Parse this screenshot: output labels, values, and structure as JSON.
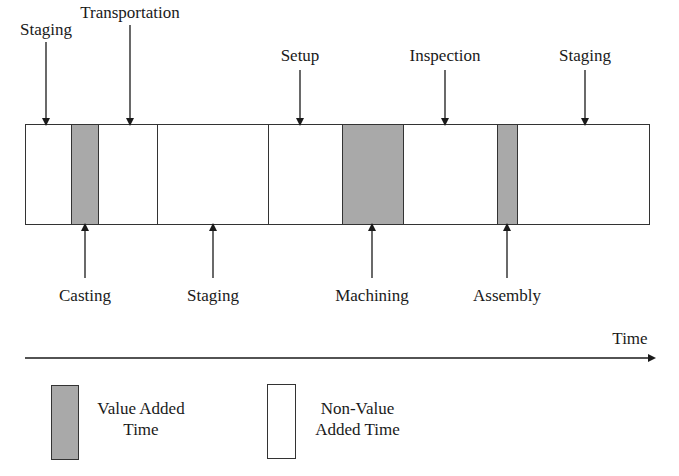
{
  "diagram": {
    "type": "value-stream-timeline",
    "segments": [
      {
        "name": "Staging",
        "kind": "non-value-added",
        "x0": 25,
        "x1": 71,
        "label_position": "top"
      },
      {
        "name": "Casting",
        "kind": "value-added",
        "x0": 71,
        "x1": 98,
        "label_position": "bottom"
      },
      {
        "name": "Transportation",
        "kind": "non-value-added",
        "x0": 98,
        "x1": 157,
        "label_position": "top"
      },
      {
        "name": "Staging",
        "kind": "non-value-added",
        "x0": 157,
        "x1": 268,
        "label_position": "bottom"
      },
      {
        "name": "Setup",
        "kind": "non-value-added",
        "x0": 268,
        "x1": 342,
        "label_position": "top"
      },
      {
        "name": "Machining",
        "kind": "value-added",
        "x0": 342,
        "x1": 403,
        "label_position": "bottom"
      },
      {
        "name": "Inspection",
        "kind": "non-value-added",
        "x0": 403,
        "x1": 497,
        "label_position": "top"
      },
      {
        "name": "Assembly",
        "kind": "value-added",
        "x0": 497,
        "x1": 517,
        "label_position": "bottom"
      },
      {
        "name": "Staging",
        "kind": "non-value-added",
        "x0": 517,
        "x1": 650,
        "label_position": "top"
      }
    ],
    "top_labels": [
      {
        "text": "Staging",
        "x": 46,
        "y": 22,
        "arrow_x": 46
      },
      {
        "text": "Transportation",
        "x": 130,
        "y": 5,
        "arrow_x": 130
      },
      {
        "text": "Setup",
        "x": 300,
        "y": 48,
        "arrow_x": 300
      },
      {
        "text": "Inspection",
        "x": 445,
        "y": 48,
        "arrow_x": 445
      },
      {
        "text": "Staging",
        "x": 585,
        "y": 48,
        "arrow_x": 585
      }
    ],
    "bottom_labels": [
      {
        "text": "Casting",
        "x": 85,
        "arrow_x": 85
      },
      {
        "text": "Staging",
        "x": 213,
        "arrow_x": 213
      },
      {
        "text": "Machining",
        "x": 372,
        "arrow_x": 372
      },
      {
        "text": "Assembly",
        "x": 507,
        "arrow_x": 507
      }
    ],
    "axis": {
      "label": "Time"
    },
    "legend": [
      {
        "label_line1": "Value Added",
        "label_line2": "Time",
        "fill": "#a9a9a9"
      },
      {
        "label_line1": "Non-Value",
        "label_line2": "Added Time",
        "fill": "#ffffff"
      }
    ],
    "colors": {
      "value_added": "#a9a9a9",
      "non_value_added": "#ffffff",
      "stroke": "#333333"
    }
  }
}
